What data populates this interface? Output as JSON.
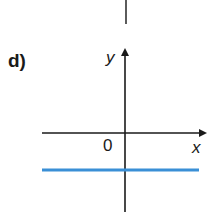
{
  "part_label": "d)",
  "axes": {
    "x_label": "x",
    "y_label": "y",
    "origin_label": "0"
  },
  "colors": {
    "axis": "#1a1a1a",
    "line": "#3a8fd6"
  },
  "graph": {
    "description": "Horizontal line y = c with c < 0, below the x-axis",
    "line_type": "horizontal",
    "position": "below x-axis"
  }
}
